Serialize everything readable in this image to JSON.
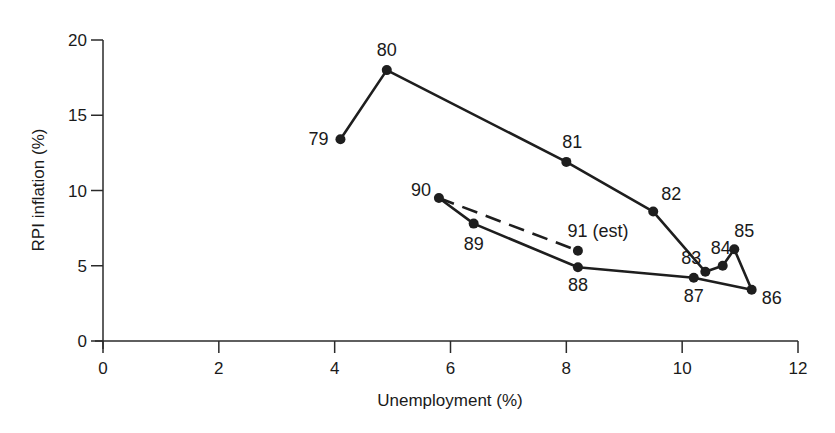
{
  "chart_data": {
    "type": "line",
    "title": "",
    "xlabel": "Unemployment (%)",
    "ylabel": "RPI inflation (%)",
    "xlim": [
      0,
      12
    ],
    "ylim": [
      0,
      20
    ],
    "xticks": [
      0,
      2,
      4,
      6,
      8,
      10,
      12
    ],
    "yticks": [
      0,
      5,
      10,
      15,
      20
    ],
    "grid": false,
    "legend": null,
    "series": [
      {
        "name": "actual",
        "style": "solid",
        "points": [
          {
            "label": "79",
            "x": 4.1,
            "y": 13.4
          },
          {
            "label": "80",
            "x": 4.9,
            "y": 18.0
          },
          {
            "label": "81",
            "x": 8.0,
            "y": 11.9
          },
          {
            "label": "82",
            "x": 9.5,
            "y": 8.6
          },
          {
            "label": "83",
            "x": 10.4,
            "y": 4.6
          },
          {
            "label": "84",
            "x": 10.7,
            "y": 5.0
          },
          {
            "label": "85",
            "x": 10.9,
            "y": 6.1
          },
          {
            "label": "86",
            "x": 11.2,
            "y": 3.4
          },
          {
            "label": "87",
            "x": 10.2,
            "y": 4.2
          },
          {
            "label": "88",
            "x": 8.2,
            "y": 4.9
          },
          {
            "label": "89",
            "x": 6.4,
            "y": 7.8
          },
          {
            "label": "90",
            "x": 5.8,
            "y": 9.5
          }
        ]
      },
      {
        "name": "estimate",
        "style": "dashed",
        "points": [
          {
            "label": "90",
            "x": 5.8,
            "y": 9.5
          },
          {
            "label": "91 (est)",
            "x": 8.2,
            "y": 6.0
          }
        ]
      }
    ]
  },
  "axes": {
    "x_label": "Unemployment (%)",
    "y_label": "RPI inflation (%)"
  }
}
